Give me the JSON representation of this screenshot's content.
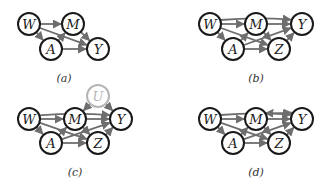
{
  "panels": [
    {
      "id": "a",
      "caption": "(a)",
      "caption_pos": [
        64,
        72
      ],
      "nodes": [
        {
          "id": "W",
          "label": "W",
          "x": 29,
          "y": 24
        },
        {
          "id": "M",
          "label": "M",
          "x": 73,
          "y": 24
        },
        {
          "id": "A",
          "label": "A",
          "x": 51,
          "y": 49
        },
        {
          "id": "Y",
          "label": "Y",
          "x": 98,
          "y": 49
        }
      ],
      "edges": [
        {
          "from": "W",
          "to": "M"
        },
        {
          "from": "W",
          "to": "A"
        },
        {
          "from": "W",
          "to": "Y"
        },
        {
          "from": "A",
          "to": "M"
        },
        {
          "from": "A",
          "to": "Y"
        },
        {
          "from": "M",
          "to": "Y"
        }
      ]
    },
    {
      "id": "b",
      "caption": "(b)",
      "caption_pos": [
        256,
        72
      ],
      "nodes": [
        {
          "id": "W",
          "label": "W",
          "x": 210,
          "y": 24
        },
        {
          "id": "M",
          "label": "M",
          "x": 256,
          "y": 24
        },
        {
          "id": "Y",
          "label": "Y",
          "x": 302,
          "y": 24
        },
        {
          "id": "A",
          "label": "A",
          "x": 233,
          "y": 49
        },
        {
          "id": "Z",
          "label": "Z",
          "x": 279,
          "y": 49
        }
      ],
      "edges": [
        {
          "from": "W",
          "to": "M"
        },
        {
          "from": "W",
          "to": "A"
        },
        {
          "from": "W",
          "to": "Z"
        },
        {
          "from": "W",
          "to": "Y",
          "curve": -18
        },
        {
          "from": "A",
          "to": "M"
        },
        {
          "from": "A",
          "to": "Z"
        },
        {
          "from": "A",
          "to": "Y"
        },
        {
          "from": "M",
          "to": "Y"
        },
        {
          "from": "M",
          "to": "Z"
        },
        {
          "from": "Z",
          "to": "Y"
        }
      ]
    },
    {
      "id": "c",
      "caption": "(c)",
      "caption_pos": [
        75,
        166
      ],
      "nodes": [
        {
          "id": "W",
          "label": "W",
          "x": 29,
          "y": 119
        },
        {
          "id": "M",
          "label": "M",
          "x": 75,
          "y": 119
        },
        {
          "id": "Y",
          "label": "Y",
          "x": 121,
          "y": 119
        },
        {
          "id": "A",
          "label": "A",
          "x": 51,
          "y": 143
        },
        {
          "id": "Z",
          "label": "Z",
          "x": 98,
          "y": 143
        },
        {
          "id": "U",
          "label": "U",
          "x": 98,
          "y": 96,
          "latent": true
        }
      ],
      "edges": [
        {
          "from": "W",
          "to": "M"
        },
        {
          "from": "W",
          "to": "A"
        },
        {
          "from": "W",
          "to": "Z"
        },
        {
          "from": "W",
          "to": "Y",
          "curve": -16
        },
        {
          "from": "A",
          "to": "M"
        },
        {
          "from": "A",
          "to": "Z"
        },
        {
          "from": "A",
          "to": "Y"
        },
        {
          "from": "M",
          "to": "Y"
        },
        {
          "from": "M",
          "to": "Z"
        },
        {
          "from": "Z",
          "to": "Y"
        },
        {
          "from": "U",
          "to": "M"
        },
        {
          "from": "U",
          "to": "Y"
        }
      ]
    },
    {
      "id": "d",
      "caption": "(d)",
      "caption_pos": [
        256,
        166
      ],
      "nodes": [
        {
          "id": "W",
          "label": "W",
          "x": 210,
          "y": 119
        },
        {
          "id": "M",
          "label": "M",
          "x": 256,
          "y": 119
        },
        {
          "id": "Y",
          "label": "Y",
          "x": 302,
          "y": 119
        },
        {
          "id": "A",
          "label": "A",
          "x": 233,
          "y": 143
        },
        {
          "id": "Z",
          "label": "Z",
          "x": 279,
          "y": 143
        }
      ],
      "edges": [
        {
          "from": "W",
          "to": "M"
        },
        {
          "from": "W",
          "to": "A"
        },
        {
          "from": "W",
          "to": "Z"
        },
        {
          "from": "W",
          "to": "Y",
          "curve": -18
        },
        {
          "from": "A",
          "to": "M"
        },
        {
          "from": "A",
          "to": "Z"
        },
        {
          "from": "A",
          "to": "Y"
        },
        {
          "from": "M",
          "to": "Y"
        },
        {
          "from": "M",
          "to": "Z"
        },
        {
          "from": "Z",
          "to": "Y"
        },
        {
          "from": "M",
          "to": "Y",
          "curve": -14,
          "bidirected": true
        }
      ]
    }
  ],
  "style": {
    "node_radius": 11,
    "node_stroke": "#1a1a1a",
    "latent_stroke": "#b5b5b5",
    "edge_color": "#6e6e6e"
  }
}
